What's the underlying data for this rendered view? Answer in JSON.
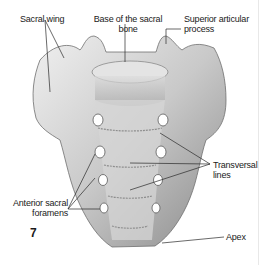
{
  "figure": {
    "number": "7",
    "colors": {
      "bone_light": "#e9e9e9",
      "bone_mid": "#bdbdbd",
      "bone_dark": "#7d7d7d",
      "foramen": "#ffffff",
      "leader_line": "#2a2a2a",
      "text": "#1a1a1a"
    },
    "labels": [
      {
        "id": "sacral-wing",
        "text": "Sacral wing"
      },
      {
        "id": "base-sacral-bone",
        "line1": "Base of the sacral",
        "line2": "bone"
      },
      {
        "id": "superior-articular-process",
        "line1": "Superior articular",
        "line2": "process"
      },
      {
        "id": "transversal-lines",
        "line1": "Transversal",
        "line2": "lines"
      },
      {
        "id": "anterior-sacral-foramens",
        "line1": "Anterior sacral",
        "line2": "foramens"
      },
      {
        "id": "apex",
        "text": "Apex"
      }
    ]
  }
}
